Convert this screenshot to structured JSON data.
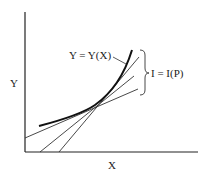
{
  "diagram": {
    "axes": {
      "x_label": "X",
      "y_label": "Y"
    },
    "curve_label": "Y = Y(X)",
    "tangent_family_label": "I = I(P)",
    "colors": {
      "ink": "#222222",
      "background": "#ffffff"
    }
  }
}
